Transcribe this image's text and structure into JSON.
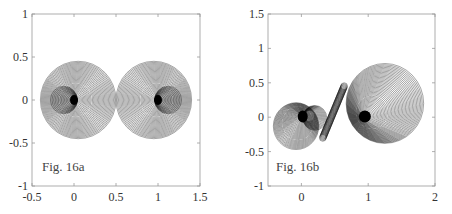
{
  "chart_data": [
    {
      "type": "line",
      "id": "fig16a",
      "title": "",
      "annotation": "Fig. 16a",
      "xlabel": "",
      "ylabel": "",
      "xlim": [
        -0.5,
        1.5
      ],
      "ylim": [
        -1,
        1
      ],
      "xticks": [
        "-0.5",
        "0",
        "0.5",
        "1",
        "1.5"
      ],
      "yticks": [
        "1",
        "0.5",
        "0",
        "-0.5",
        "-1"
      ],
      "grid": false,
      "legend": null,
      "description": "Family of nested circles forming a symmetric dumbbell/peanut shape around foci (0,0) and (1,0); outer envelope spans x from about -0.3 to 1.3 and y from about -0.45 to 0.45, pinching near x=0.5",
      "series": [
        {
          "name": "left lobe",
          "center": [
            0,
            0
          ],
          "outer_extent_x": [
            -0.3,
            0.5
          ],
          "outer_extent_y": [
            -0.45,
            0.45
          ]
        },
        {
          "name": "right lobe",
          "center": [
            1,
            0
          ],
          "outer_extent_x": [
            0.5,
            1.3
          ],
          "outer_extent_y": [
            -0.45,
            0.45
          ]
        }
      ]
    },
    {
      "type": "line",
      "id": "fig16b",
      "title": "",
      "annotation": "Fig. 16b",
      "xlabel": "",
      "ylabel": "",
      "xlim": [
        -0.5,
        2
      ],
      "ylim": [
        -1,
        1.5
      ],
      "xticks": [
        "0",
        "1",
        "2"
      ],
      "yticks": [
        "1.5",
        "1",
        "0.5",
        "0",
        "-0.5",
        "-1"
      ],
      "grid": false,
      "legend": null,
      "description": "Asymmetric family of circles: small spiral lobe around (0,0) extending to about (-0.45,-0.45), a dense S-shaped strip through (0.5,0.15), and a large disc around (1.25,0.2) of radius about 0.58 with a dark core near (0.95,0)",
      "series": [
        {
          "name": "small lobe",
          "center": [
            0,
            0
          ],
          "outer_extent_x": [
            -0.45,
            0.45
          ],
          "outer_extent_y": [
            -0.45,
            0.22
          ]
        },
        {
          "name": "large lobe",
          "center": [
            1,
            0
          ],
          "outer_extent_x": [
            0.5,
            1.8
          ],
          "outer_extent_y": [
            -0.38,
            0.78
          ]
        }
      ]
    }
  ],
  "panels": {
    "left": {
      "label": "Fig. 16a"
    },
    "right": {
      "label": "Fig. 16b"
    }
  }
}
